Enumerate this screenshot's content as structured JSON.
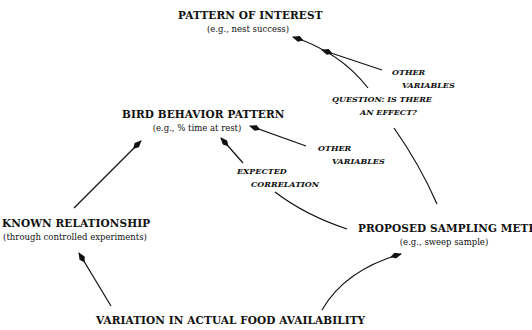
{
  "nodes": {
    "pattern_of_interest": {
      "title": "PATTERN OF INTEREST",
      "example": "(e.g., nest success)"
    },
    "bird_behavior": {
      "title": "BIRD BEHAVIOR PATTERN",
      "example": "(e.g., % time at rest)"
    },
    "known_relationship": {
      "title": "KNOWN RELATIONSHIP",
      "example": "(through controlled experiments)"
    },
    "proposed_sampling": {
      "title": "PROPOSED SAMPLING METHOD",
      "example": "(e.g., sweep sample)"
    },
    "food_variation": {
      "title": "VARIATION IN ACTUAL FOOD AVAILABILITY"
    }
  },
  "edge_labels": {
    "other_variables_top": [
      "OTHER",
      "VARIABLES"
    ],
    "question": [
      "QUESTION: IS THERE",
      "AN EFFECT?"
    ],
    "other_variables_mid": [
      "OTHER",
      "VARIABLES"
    ],
    "expected_correlation": [
      "EXPECTED",
      "CORRELATION"
    ]
  }
}
